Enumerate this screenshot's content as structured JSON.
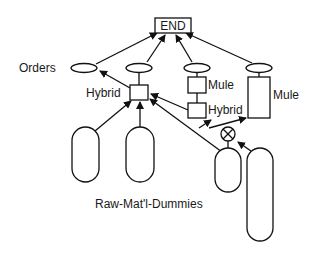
{
  "diagram": {
    "end_node": {
      "label": "END"
    },
    "labels": {
      "orders": "Orders",
      "hybrid_left": "Hybrid",
      "mule_middle": "Mule",
      "hybrid_middle": "Hybrid",
      "mule_right": "Mule",
      "raw_materials": "Raw-Mat'l-Dummies"
    },
    "nodes": [
      {
        "id": "end",
        "type": "rectangle",
        "label": "END"
      },
      {
        "id": "orders-place",
        "type": "ellipse",
        "label": "Orders"
      },
      {
        "id": "place-2",
        "type": "ellipse"
      },
      {
        "id": "place-3",
        "type": "ellipse"
      },
      {
        "id": "place-4",
        "type": "ellipse"
      },
      {
        "id": "hybrid-left",
        "type": "rectangle",
        "label": "Hybrid"
      },
      {
        "id": "mule-middle",
        "type": "rectangle",
        "label": "Mule"
      },
      {
        "id": "hybrid-middle",
        "type": "rectangle",
        "label": "Hybrid"
      },
      {
        "id": "mule-right",
        "type": "rectangle",
        "label": "Mule"
      },
      {
        "id": "xor-junction",
        "type": "circle-x"
      },
      {
        "id": "raw-1",
        "type": "capsule"
      },
      {
        "id": "raw-2",
        "type": "capsule"
      },
      {
        "id": "raw-3",
        "type": "capsule"
      },
      {
        "id": "raw-4",
        "type": "capsule"
      }
    ],
    "edges": [
      {
        "from": "orders-place",
        "to": "end"
      },
      {
        "from": "place-2",
        "to": "end"
      },
      {
        "from": "place-3",
        "to": "end"
      },
      {
        "from": "place-4",
        "to": "end"
      },
      {
        "from": "hybrid-left",
        "to": "orders-place"
      },
      {
        "from": "hybrid-left",
        "to": "place-2"
      },
      {
        "from": "raw-1",
        "to": "hybrid-left"
      },
      {
        "from": "raw-2",
        "to": "hybrid-left"
      },
      {
        "from": "raw-3",
        "to": "hybrid-left"
      },
      {
        "from": "mule-middle",
        "to": "place-3"
      },
      {
        "from": "hybrid-middle",
        "to": "mule-middle"
      },
      {
        "from": "xor-junction",
        "to": "hybrid-middle"
      },
      {
        "from": "xor-junction",
        "to": "mule-right"
      },
      {
        "from": "raw-3",
        "to": "xor-junction"
      },
      {
        "from": "raw-4",
        "to": "xor-junction"
      },
      {
        "from": "mule-right",
        "to": "place-4"
      }
    ],
    "colors": {
      "stroke": "#111111",
      "fill": "#ffffff",
      "text": "#1a1a1a"
    }
  }
}
